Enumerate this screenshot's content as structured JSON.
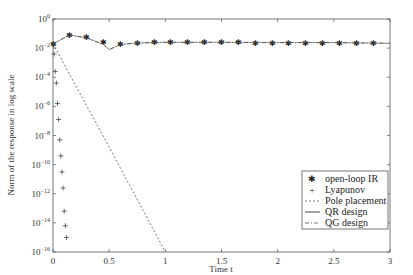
{
  "chart_data": {
    "type": "line",
    "title": "",
    "xlabel": "Time t",
    "ylabel": "Norm of the response in log scale",
    "xlim": [
      0,
      3
    ],
    "ylim_log10": [
      -16,
      0
    ],
    "yscale": "log",
    "x_ticks": [
      "0",
      "0.5",
      "1",
      "1.5",
      "2",
      "2.5",
      "3"
    ],
    "x_tick_values": [
      0,
      0.5,
      1,
      1.5,
      2,
      2.5,
      3
    ],
    "y_ticks": [
      "10^0",
      "10^-2",
      "10^-4",
      "10^-6",
      "10^-8",
      "10^-10",
      "10^-12",
      "10^-14",
      "10^-16"
    ],
    "y_tick_exponents": [
      0,
      -2,
      -4,
      -6,
      -8,
      -10,
      -12,
      -14,
      -16
    ],
    "grid": false,
    "legend_position": "lower right",
    "series": [
      {
        "name": "open-loop IR",
        "style": "star markers",
        "x": [
          0.0,
          0.15,
          0.3,
          0.45,
          0.6,
          0.75,
          0.9,
          1.05,
          1.2,
          1.35,
          1.5,
          1.65,
          1.8,
          1.95,
          2.1,
          2.25,
          2.4,
          2.55,
          2.7,
          2.85
        ],
        "log10_y": [
          -1.7,
          -1.1,
          -1.25,
          -1.6,
          -1.75,
          -1.65,
          -1.6,
          -1.6,
          -1.6,
          -1.6,
          -1.6,
          -1.6,
          -1.62,
          -1.62,
          -1.62,
          -1.62,
          -1.62,
          -1.62,
          -1.65,
          -1.65
        ]
      },
      {
        "name": "Lyapunov",
        "style": "plus markers",
        "x": [
          0.01,
          0.02,
          0.03,
          0.04,
          0.05,
          0.06,
          0.07,
          0.08,
          0.09,
          0.1,
          0.11,
          0.12
        ],
        "log10_y": [
          -2.4,
          -3.6,
          -4.4,
          -5.8,
          -6.9,
          -8.3,
          -9.4,
          -10.5,
          -11.6,
          -13.2,
          -14.2,
          -15
        ]
      },
      {
        "name": "Pole placement",
        "style": "dashed",
        "x": [
          0.0,
          0.5,
          1.0
        ],
        "log10_y": [
          -1.7,
          -8.8,
          -16
        ]
      },
      {
        "name": "QR design",
        "style": "solid",
        "x": [
          0.0,
          0.15,
          0.3,
          0.45,
          0.5,
          0.6,
          0.75,
          1.0,
          1.5,
          2.0,
          2.5,
          3.0
        ],
        "log10_y": [
          -1.7,
          -1.1,
          -1.3,
          -1.75,
          -2.1,
          -1.75,
          -1.65,
          -1.6,
          -1.6,
          -1.62,
          -1.62,
          -1.67
        ]
      },
      {
        "name": "QG design",
        "style": "dash-dot",
        "x": [
          0.0,
          0.15,
          0.3,
          0.45,
          0.5,
          0.6,
          0.75,
          1.0,
          1.5,
          2.0,
          2.5,
          3.0
        ],
        "log10_y": [
          -1.7,
          -1.1,
          -1.3,
          -1.75,
          -2.1,
          -1.75,
          -1.65,
          -1.6,
          -1.6,
          -1.62,
          -1.62,
          -1.67
        ]
      }
    ]
  },
  "legend": {
    "items": [
      "open-loop IR",
      "Lyapunov",
      "Pole placement",
      "QR design",
      "QG design"
    ]
  },
  "axes": {
    "xlabel": "Time t",
    "ylabel": "Norm of the response in log scale"
  }
}
